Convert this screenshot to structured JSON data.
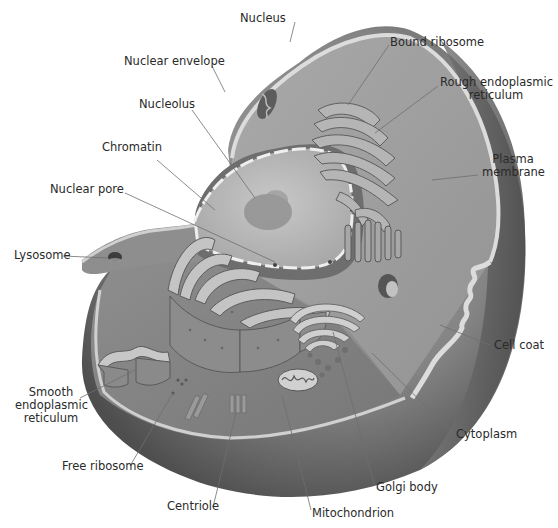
{
  "diagram": {
    "labels": {
      "nucleus": "Nucleus",
      "nuclear_envelope": "Nuclear envelope",
      "nucleolus": "Nucleolus",
      "chromatin": "Chromatin",
      "nuclear_pore": "Nuclear pore",
      "lysosome": "Lysosome",
      "smooth_er_1": "Smooth",
      "smooth_er_2": "endoplasmic",
      "smooth_er_3": "reticulum",
      "free_ribosome": "Free ribosome",
      "centriole": "Centriole",
      "mitochondrion": "Mitochondrion",
      "golgi_body": "Golgi body",
      "cytoplasm": "Cytoplasm",
      "cell_coat": "Cell coat",
      "plasma_membrane_1": "Plasma",
      "plasma_membrane_2": "membrane",
      "rough_er_1": "Rough endoplasmic",
      "rough_er_2": "reticulum",
      "bound_ribosome": "Bound ribosome"
    },
    "colors": {
      "background": "#ffffff",
      "cell_outer": "#8a8a8a",
      "cell_dark": "#5e5e5e",
      "cytoplasm": "#9c9c9c",
      "membrane": "#d8d8d8",
      "nucleus": "#b9b9b9",
      "text": "#2a2a2a",
      "leader": "#6f6f6f"
    }
  }
}
